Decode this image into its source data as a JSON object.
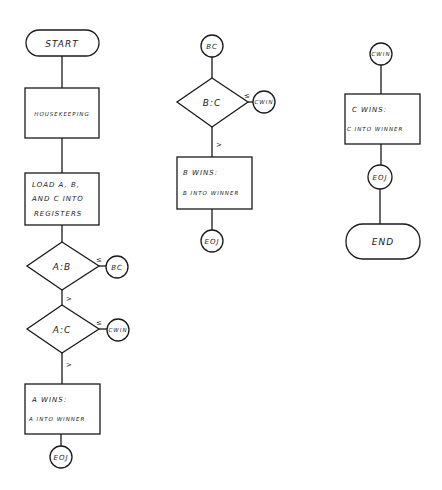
{
  "diagram": {
    "type": "flowchart",
    "style": "hand-drawn",
    "colors": {
      "ink": "#1a1a1a",
      "background": "#ffffff"
    },
    "column1": {
      "start": {
        "label": "START"
      },
      "housekeeping": {
        "label": "HOUSEKEEPING"
      },
      "load": {
        "line1": "LOAD A, B,",
        "line2": "AND C INTO",
        "line3": "REGISTERS"
      },
      "decision_ab": {
        "label": "A:B",
        "yes_label": "≤",
        "no_label": ">"
      },
      "connector_bc": {
        "label": "BC"
      },
      "decision_ac": {
        "label": "A:C",
        "yes_label": "≤",
        "no_label": ">"
      },
      "connector_cwin": {
        "label": "CWIN"
      },
      "a_wins": {
        "line1": "A   WINS:",
        "line2": "A INTO WINNER"
      },
      "eoj": {
        "label": "EOJ"
      }
    },
    "column2": {
      "connector_bc": {
        "label": "BC"
      },
      "decision_bc": {
        "label": "B:C",
        "yes_label": "≤",
        "no_label": ">"
      },
      "connector_cwin": {
        "label": "CWIN"
      },
      "b_wins": {
        "line1": "B    WINS:",
        "line2": "B  INTO WINNER"
      },
      "eoj": {
        "label": "EOJ"
      }
    },
    "column3": {
      "connector_cwin": {
        "label": "CWIN"
      },
      "c_wins": {
        "line1": "C   WINS:",
        "line2": "C INTO WINNER"
      },
      "eoj": {
        "label": "EOJ"
      },
      "end": {
        "label": "END"
      }
    }
  }
}
